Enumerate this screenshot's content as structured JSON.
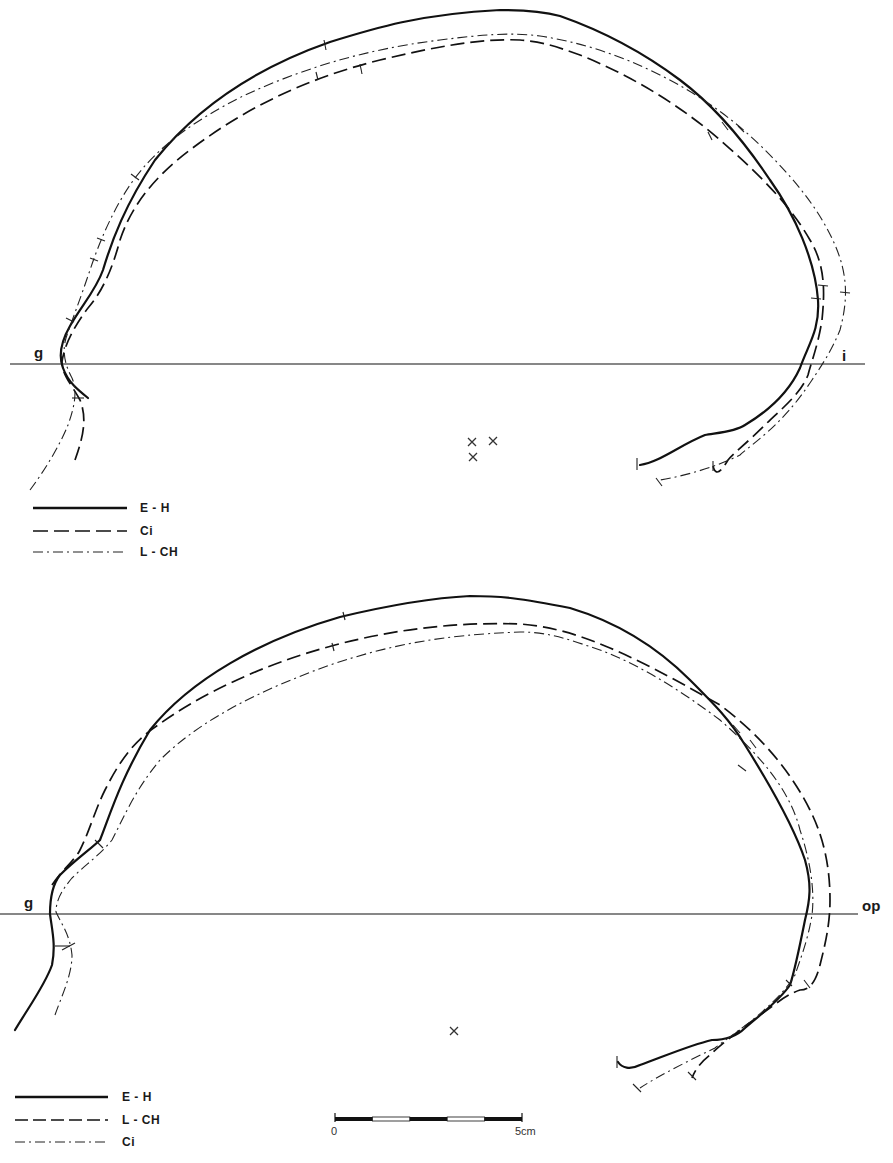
{
  "figures": [
    {
      "id": "top",
      "baseline": {
        "left_label": "g",
        "right_label": "i",
        "y": 364
      },
      "legend": [
        {
          "style": "solid",
          "label": "E - H"
        },
        {
          "style": "dashed",
          "label": "Ci"
        },
        {
          "style": "dash-dot",
          "label": "L - CH"
        }
      ],
      "center_marks": 3
    },
    {
      "id": "bottom",
      "baseline": {
        "left_label": "g",
        "right_label": "op",
        "y": 914
      },
      "legend": [
        {
          "style": "solid",
          "label": "E - H"
        },
        {
          "style": "dashed",
          "label": "L - CH"
        },
        {
          "style": "dash-dot",
          "label": "Ci"
        }
      ],
      "center_marks": 1
    }
  ],
  "scale_bar": {
    "start_label": "0",
    "end_label": "5cm",
    "segments": 5
  },
  "colors": {
    "ink": "#111111",
    "background": "#ffffff"
  }
}
